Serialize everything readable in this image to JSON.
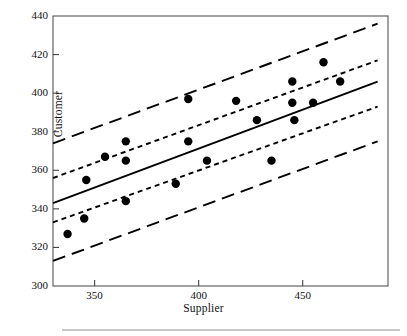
{
  "chart_data": {
    "type": "scatter",
    "title": "",
    "xlabel": "Supplier",
    "ylabel": "Customer",
    "xlim": [
      330,
      491
    ],
    "ylim": [
      300,
      440
    ],
    "xticks": [
      350,
      400,
      450
    ],
    "yticks": [
      300,
      320,
      340,
      360,
      380,
      400,
      420,
      440
    ],
    "grid": false,
    "legend": null,
    "points": [
      {
        "x": 337,
        "y": 327
      },
      {
        "x": 345,
        "y": 335
      },
      {
        "x": 346,
        "y": 355
      },
      {
        "x": 355,
        "y": 367
      },
      {
        "x": 365,
        "y": 365
      },
      {
        "x": 365,
        "y": 375
      },
      {
        "x": 365,
        "y": 344
      },
      {
        "x": 389,
        "y": 353
      },
      {
        "x": 395,
        "y": 397
      },
      {
        "x": 395,
        "y": 375
      },
      {
        "x": 404,
        "y": 365
      },
      {
        "x": 418,
        "y": 396
      },
      {
        "x": 428,
        "y": 386
      },
      {
        "x": 435,
        "y": 365
      },
      {
        "x": 445,
        "y": 406
      },
      {
        "x": 445,
        "y": 395
      },
      {
        "x": 446,
        "y": 386
      },
      {
        "x": 455,
        "y": 395
      },
      {
        "x": 460,
        "y": 416
      },
      {
        "x": 468,
        "y": 406
      }
    ],
    "series": [
      {
        "name": "regression-line",
        "style": "solid",
        "x": [
          330,
          486
        ],
        "y": [
          343,
          406
        ]
      },
      {
        "name": "confidence-band-upper",
        "style": "short-dash",
        "x": [
          330,
          486
        ],
        "y": [
          356,
          417
        ]
      },
      {
        "name": "confidence-band-lower",
        "style": "short-dash",
        "x": [
          330,
          486
        ],
        "y": [
          333,
          393
        ]
      },
      {
        "name": "prediction-band-upper",
        "style": "long-dash",
        "x": [
          330,
          486
        ],
        "y": [
          374,
          436
        ]
      },
      {
        "name": "prediction-band-lower",
        "style": "long-dash",
        "x": [
          330,
          486
        ],
        "y": [
          313,
          375
        ]
      }
    ]
  },
  "figure": {
    "axis_color": "#444444",
    "line_color": "#000000",
    "marker_color": "#000000",
    "marker_size": 4.2,
    "caption_rule": true
  }
}
